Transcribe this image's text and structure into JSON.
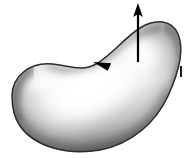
{
  "figure": {
    "name": "oriented-surface-with-normal-vector",
    "background_color": "#ffffff",
    "width": 195,
    "height": 158,
    "caption": "",
    "surface": {
      "name": "shaded-bean-surface",
      "description": "kidney/bean shaped smooth shaded 3D surface patch",
      "outline_color": "#2b2b2b",
      "highlight_color": "#ffffff",
      "midtone_color": "#d9d9d9",
      "shadow_color": "#6e6e6e",
      "deep_shadow_color": "#4a4a4a",
      "path": "M 12 96 C 12 76, 30 62, 52 64 C 70 66, 82 72, 96 64 C 112 55, 124 38, 140 28 C 156 18, 172 20, 178 34 C 185 50, 178 74, 168 96 C 156 122, 132 144, 100 150 C 66 156, 34 146, 20 126 C 13 116, 12 106, 12 96 Z"
    },
    "normal_vector": {
      "name": "normal-vector-arrow",
      "label": "",
      "color": "#000000",
      "tail_x": 138,
      "tail_y": 62,
      "tip_x": 138,
      "tip_y": 3,
      "direction": "up",
      "line_width": 2.2
    },
    "boundary_orientation_arrow": {
      "name": "boundary-orientation-arrowhead",
      "label": "",
      "color": "#000000",
      "x": 93,
      "y": 62,
      "angle_deg": 205,
      "description": "arrowhead on the surface edge indicating boundary traversal direction"
    },
    "tick_mark": {
      "name": "edge-tick-mark",
      "label": "",
      "color": "#1a1a1a",
      "x": 180,
      "y": 66,
      "width": 2,
      "height": 11,
      "description": "small vertical tick mark to the right of the surface"
    }
  }
}
